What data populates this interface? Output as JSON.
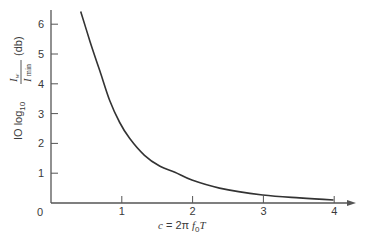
{
  "chart_data": {
    "type": "line",
    "title": "",
    "xlabel": "c = 2π f₀T",
    "ylabel": "10 log₁₀ (I_w / I_min) (db)",
    "xlim": [
      0,
      4.2
    ],
    "ylim": [
      0,
      6.5
    ],
    "grid": false,
    "legend": null,
    "x_ticks": [
      "0",
      "1",
      "2",
      "3",
      "4"
    ],
    "y_ticks": [
      "1",
      "2",
      "3",
      "4",
      "5",
      "6"
    ],
    "series": [
      {
        "name": "curve",
        "x": [
          0.42,
          0.55,
          0.69,
          0.83,
          0.97,
          1.11,
          1.32,
          1.54,
          1.75,
          1.99,
          2.38,
          2.99,
          3.51,
          3.99
        ],
        "y": [
          6.43,
          5.43,
          4.43,
          3.43,
          2.7,
          2.17,
          1.6,
          1.23,
          1.03,
          0.77,
          0.5,
          0.27,
          0.17,
          0.1
        ]
      }
    ]
  },
  "labels": {
    "origin": "0",
    "x_axis_label_c": "c",
    "x_axis_label_eq": " = 2",
    "x_axis_label_pi": "π",
    "x_axis_label_f": " f",
    "x_axis_label_sub": "0",
    "x_axis_label_T": "T",
    "y_axis_prefix": "IO log",
    "y_axis_sub": "10",
    "y_axis_num": "I",
    "y_axis_num_sub": "w",
    "y_axis_den": "I",
    "y_axis_den_sub": "min",
    "y_axis_unit": "(db)"
  }
}
